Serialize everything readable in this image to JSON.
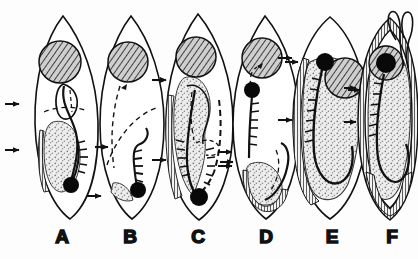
{
  "figure": {
    "type": "scientific-line-diagram",
    "background_color": "#fdfdfd",
    "ink_color": "#101010",
    "stipple_color": "#b9b9b9",
    "hatch_color": "#2a2a2a",
    "panel_count": 6,
    "sequence_direction": "left-to-right",
    "panels": [
      {
        "id": "A",
        "label": "A",
        "label_x": 62,
        "label_y": 243,
        "body_cx": 66,
        "body_cy": 120,
        "body_rx": 33,
        "body_ry": 104,
        "body_rotate": -4,
        "body_shape": "pointed-ovoid",
        "nucleus_cx": 60,
        "nucleus_cy": 62,
        "nucleus_r": 21,
        "nucleus_fill": "cross-hatch",
        "stipple_mass": "small elongate ventral mass, lower-left",
        "black_dot_cx": 71,
        "black_dot_cy": 185,
        "black_dot_r": 8,
        "comb_band": "short, lower right of mass",
        "dashed_lines": 1,
        "margin_striation": "none",
        "left_arrows": [
          104,
          150
        ],
        "arrow_to_next": true,
        "apical_loop": false
      },
      {
        "id": "B",
        "label": "B",
        "label_x": 130,
        "label_y": 243,
        "body_cx": 132,
        "body_cy": 120,
        "body_rx": 33,
        "body_ry": 104,
        "body_rotate": 2,
        "body_shape": "pointed-ovoid",
        "nucleus_cx": 128,
        "nucleus_cy": 62,
        "nucleus_r": 20,
        "nucleus_fill": "cross-hatch",
        "stipple_mass": "small crescent at base",
        "black_dot_cx": 136,
        "black_dot_cy": 185,
        "black_dot_r": 8,
        "comb_band": "long vertical comb at centre",
        "dashed_lines": 2,
        "margin_striation": "none",
        "left_arrows": [
          196
        ],
        "arrow_to_next": true,
        "apical_loop": false
      },
      {
        "id": "C",
        "label": "C",
        "label_x": 198,
        "label_y": 243,
        "body_cx": 200,
        "body_cy": 120,
        "body_rx": 34,
        "body_ry": 105,
        "body_rotate": -2,
        "body_shape": "broad-ovoid",
        "nucleus_cx": 196,
        "nucleus_cy": 57,
        "nucleus_r": 20,
        "nucleus_fill": "cross-hatch",
        "stipple_mass": "large axial mass spanning most of body",
        "black_dot_cx": 199,
        "black_dot_cy": 197,
        "black_dot_r": 9,
        "comb_band": "long curved comb along right of mass",
        "dashed_lines": 2,
        "margin_striation": "narrow left margin",
        "left_arrows": [
          80,
          160
        ],
        "arrow_to_next": true,
        "apical_loop": false
      },
      {
        "id": "D",
        "label": "D",
        "label_x": 266,
        "label_y": 243,
        "body_cx": 266,
        "body_cy": 120,
        "body_rx": 34,
        "body_ry": 104,
        "body_rotate": 2,
        "body_shape": "broad-ovoid",
        "nucleus_cx": 262,
        "nucleus_cy": 58,
        "nucleus_r": 20,
        "nucleus_fill": "cross-hatch",
        "stipple_mass": "rounded basal mass",
        "black_dot_cx": 252,
        "black_dot_cy": 90,
        "black_dot_r": 8,
        "comb_band": "vertical comb from dot downward",
        "dashed_lines": 2,
        "margin_striation": "basal striated band",
        "left_arrows": [
          152,
          166
        ],
        "arrow_to_next": true,
        "apical_loop": false
      },
      {
        "id": "E",
        "label": "E",
        "label_x": 332,
        "label_y": 243,
        "body_cx": 330,
        "body_cy": 118,
        "body_rx": 37,
        "body_ry": 101,
        "body_rotate": 0,
        "body_shape": "wide-oval",
        "nucleus_cx": 345,
        "nucleus_cy": 78,
        "nucleus_r": 20,
        "nucleus_fill": "cross-hatch",
        "stipple_mass": "very large mass filling body",
        "black_dot_cx": 325,
        "black_dot_cy": 62,
        "black_dot_r": 9,
        "comb_band": "long comb curving down the centre",
        "dashed_lines": 0,
        "margin_striation": "dense left-margin striation",
        "left_arrows": [
          58,
          120
        ],
        "arrow_to_next": true,
        "apical_loop": false
      },
      {
        "id": "F",
        "label": "F",
        "label_x": 392,
        "label_y": 243,
        "body_cx": 390,
        "body_cy": 120,
        "body_rx": 36,
        "body_ry": 100,
        "body_rotate": 0,
        "body_shape": "wide-oval",
        "nucleus_cx": 386,
        "nucleus_cy": 63,
        "nucleus_r": 17,
        "nucleus_fill": "cross-hatch",
        "stipple_mass": "large mass filling body",
        "black_dot_cx": 386,
        "black_dot_cy": 63,
        "black_dot_r": 10,
        "comb_band": "central comb plus inner curved loop",
        "dashed_lines": 0,
        "margin_striation": "full peripheral striation incl. basal fan",
        "left_arrows": [
          88,
          122
        ],
        "arrow_to_next": false,
        "apical_loop": true,
        "apical_loop_note": "paired slender apical loops (cirri) at upper right"
      }
    ],
    "interpanel_arrows": [
      {
        "from": "A",
        "to": "B",
        "x": 102,
        "y": 147
      },
      {
        "from": "B",
        "to": "C",
        "x": 168,
        "y": 80
      },
      {
        "from": "C",
        "to": "D",
        "x": 235,
        "y": 162
      },
      {
        "from": "D",
        "to": "E",
        "x": 300,
        "y": 62
      },
      {
        "from": "E",
        "to": "F",
        "x": 366,
        "y": 90
      }
    ],
    "labels": [
      "A",
      "B",
      "C",
      "D",
      "E",
      "F"
    ]
  }
}
